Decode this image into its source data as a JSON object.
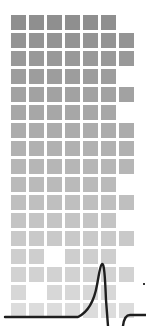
{
  "illustration": {
    "name": "heartbeat-grid",
    "background": "#ffffff",
    "grid": {
      "origin_x": 11,
      "origin_y": 15,
      "cell_size": 15,
      "pitch": 18,
      "columns": 7,
      "rows": 17,
      "color_top": "#8f8f8f",
      "color_bottom": "#dcdcdc",
      "cells": [
        [
          1,
          1,
          1,
          1,
          1,
          1,
          0
        ],
        [
          1,
          1,
          1,
          1,
          1,
          1,
          1
        ],
        [
          1,
          1,
          1,
          1,
          1,
          1,
          1
        ],
        [
          1,
          1,
          1,
          1,
          1,
          1,
          0
        ],
        [
          1,
          1,
          1,
          1,
          1,
          1,
          1
        ],
        [
          1,
          1,
          1,
          1,
          1,
          1,
          0
        ],
        [
          1,
          1,
          1,
          1,
          1,
          1,
          1
        ],
        [
          1,
          1,
          1,
          1,
          1,
          1,
          1
        ],
        [
          1,
          1,
          1,
          1,
          1,
          1,
          1
        ],
        [
          1,
          1,
          1,
          1,
          1,
          1,
          0
        ],
        [
          1,
          1,
          1,
          1,
          1,
          1,
          1
        ],
        [
          1,
          1,
          1,
          1,
          1,
          1,
          0
        ],
        [
          1,
          1,
          1,
          1,
          1,
          1,
          1
        ],
        [
          1,
          1,
          0,
          1,
          1,
          1,
          0
        ],
        [
          1,
          1,
          1,
          1,
          1,
          1,
          1
        ],
        [
          1,
          0,
          1,
          1,
          1,
          1,
          0
        ],
        [
          1,
          1,
          1,
          1,
          1,
          1,
          1
        ]
      ]
    },
    "pulse_line": {
      "color": "#1e1e1e",
      "stroke_width": 2.4,
      "path": "M 5 317 L 78 317 C 88 312 94 302 97 285 C 99 275 100 265 102 264 C 104 263 105 275 106 300 L 108 326 M 123 326 C 124 318 126 315 130 315 L 146 315"
    },
    "marks": [
      {
        "x": 143,
        "y": 283
      }
    ]
  }
}
